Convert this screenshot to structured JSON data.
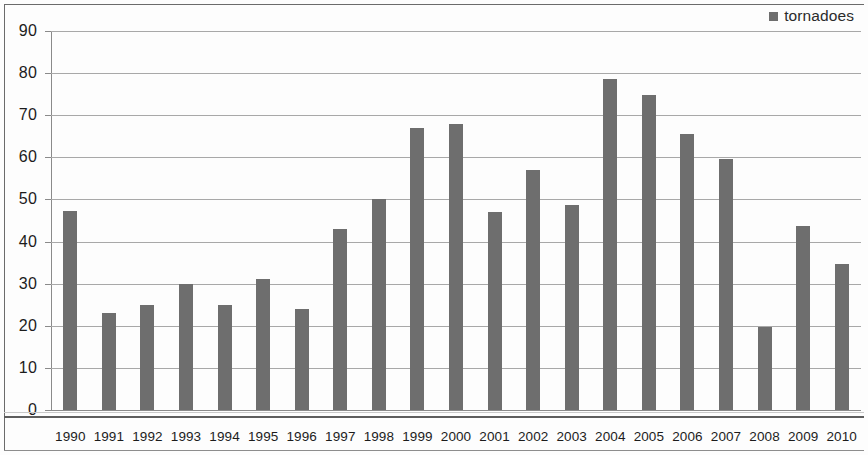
{
  "legend": {
    "marker_color": "#6e6e6e",
    "label": "tornadoes",
    "position": "top-right"
  },
  "axes": {
    "y_ticks": [
      "0",
      "10",
      "20",
      "30",
      "40",
      "50",
      "60",
      "70",
      "80",
      "90"
    ],
    "x_ticks": [
      "1990",
      "1991",
      "1992",
      "1993",
      "1994",
      "1995",
      "1996",
      "1997",
      "1998",
      "1999",
      "2000",
      "2001",
      "2002",
      "2003",
      "2004",
      "2005",
      "2006",
      "2007",
      "2008",
      "2009",
      "2010"
    ]
  },
  "chart_data": {
    "type": "bar",
    "title": "",
    "xlabel": "",
    "ylabel": "",
    "ylim": [
      0,
      90
    ],
    "ytick_step": 10,
    "grid": true,
    "legend_position": "top-right",
    "bar_color": "#6e6e6e",
    "categories": [
      "1990",
      "1991",
      "1992",
      "1993",
      "1994",
      "1995",
      "1996",
      "1997",
      "1998",
      "1999",
      "2000",
      "2001",
      "2002",
      "2003",
      "2004",
      "2005",
      "2006",
      "2007",
      "2008",
      "2009",
      "2010"
    ],
    "series": [
      {
        "name": "tornadoes",
        "values": [
          47.3,
          23,
          25,
          30,
          25,
          31,
          24,
          43,
          50,
          67,
          68,
          47,
          57,
          48.7,
          78.7,
          74.8,
          65.6,
          59.7,
          19.7,
          43.7,
          34.6
        ]
      }
    ]
  }
}
